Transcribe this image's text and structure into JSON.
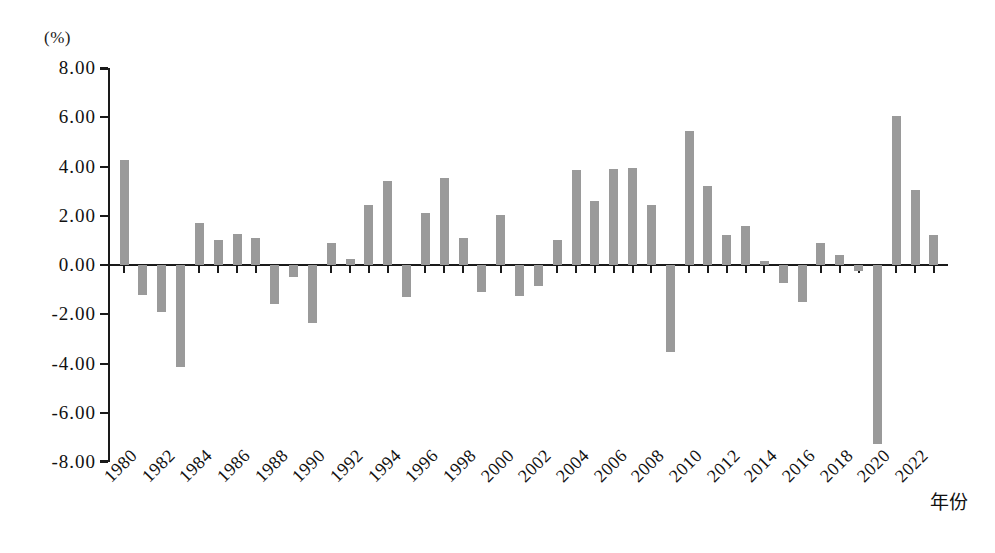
{
  "chart_data": {
    "type": "bar",
    "title": "",
    "subtitle": "",
    "xlabel": "年份",
    "ylabel": "(%)",
    "unit": "(%)",
    "ylim": [
      -8.0,
      8.0
    ],
    "ytick_step": 2.0,
    "ytick_labels": [
      "8.00",
      "6.00",
      "4.00",
      "2.00",
      "0.00",
      "-2.00",
      "-4.00",
      "-6.00",
      "-8.00"
    ],
    "ytick_values": [
      8.0,
      6.0,
      4.0,
      2.0,
      0.0,
      -2.0,
      -4.0,
      -6.0,
      -8.0
    ],
    "xtick_labels": [
      "1980",
      "1982",
      "1984",
      "1986",
      "1988",
      "1990",
      "1992",
      "1994",
      "1996",
      "1998",
      "2000",
      "2002",
      "2004",
      "2006",
      "2008",
      "2010",
      "2012",
      "2014",
      "2016",
      "2018",
      "2020",
      "2022"
    ],
    "xtick_label_rotation": -45,
    "grid": false,
    "legend": false,
    "legend_position": "none",
    "bar_color": "#9a9a9a",
    "axis_color": "#1a1a1a",
    "categories": [
      "1980",
      "1981",
      "1982",
      "1983",
      "1984",
      "1985",
      "1986",
      "1987",
      "1988",
      "1989",
      "1990",
      "1991",
      "1992",
      "1993",
      "1994",
      "1995",
      "1996",
      "1997",
      "1998",
      "1999",
      "2000",
      "2001",
      "2002",
      "2003",
      "2004",
      "2005",
      "2006",
      "2007",
      "2008",
      "2009",
      "2010",
      "2011",
      "2012",
      "2013",
      "2014",
      "2015",
      "2016",
      "2017",
      "2018",
      "2019",
      "2020",
      "2021",
      "2022",
      "2023"
    ],
    "values": [
      4.25,
      -1.2,
      -1.9,
      -4.15,
      1.7,
      1.0,
      1.25,
      1.1,
      -1.6,
      -0.5,
      -2.35,
      0.9,
      0.25,
      2.45,
      3.4,
      -1.3,
      2.1,
      3.55,
      1.1,
      -1.1,
      2.05,
      -1.25,
      -0.85,
      1.0,
      3.85,
      2.6,
      3.9,
      3.95,
      2.45,
      -3.55,
      5.45,
      3.2,
      1.2,
      1.6,
      0.15,
      -0.75,
      -1.5,
      0.9,
      0.4,
      -0.25,
      -7.25,
      6.05,
      3.05,
      1.2
    ]
  }
}
